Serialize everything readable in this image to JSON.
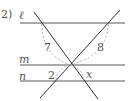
{
  "problem_number": "2)",
  "lines": {
    "l": {
      "label": "ℓ"
    },
    "m": {
      "label": "m"
    },
    "n": {
      "label": "n"
    }
  },
  "angles": {
    "a1": "7",
    "a2": "8",
    "a3": "2",
    "a4": "x"
  },
  "colors": {
    "line": "#444444",
    "arc": "#aaaaaa",
    "text": "#555555"
  }
}
